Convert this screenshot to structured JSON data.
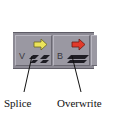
{
  "toolbar": {
    "buttons": [
      {
        "name": "splice",
        "key": "V",
        "icon": "splice-in-icon",
        "arrow_color": "#e8e04a",
        "label": "Splice"
      },
      {
        "name": "overwrite",
        "key": "B",
        "icon": "overwrite-icon",
        "arrow_color": "#e03a2a",
        "label": "Overwrite"
      }
    ]
  },
  "annotations": {
    "splice_label": "Splice",
    "overwrite_label": "Overwrite"
  }
}
